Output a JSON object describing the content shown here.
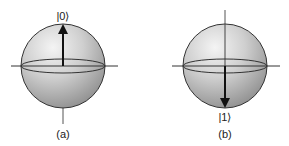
{
  "figure": {
    "panels": [
      {
        "id": "a",
        "caption": "(a)",
        "state_label": "|0⟩",
        "arrow_direction": "up"
      },
      {
        "id": "b",
        "caption": "(b)",
        "state_label": "|1⟩",
        "arrow_direction": "down"
      }
    ]
  }
}
